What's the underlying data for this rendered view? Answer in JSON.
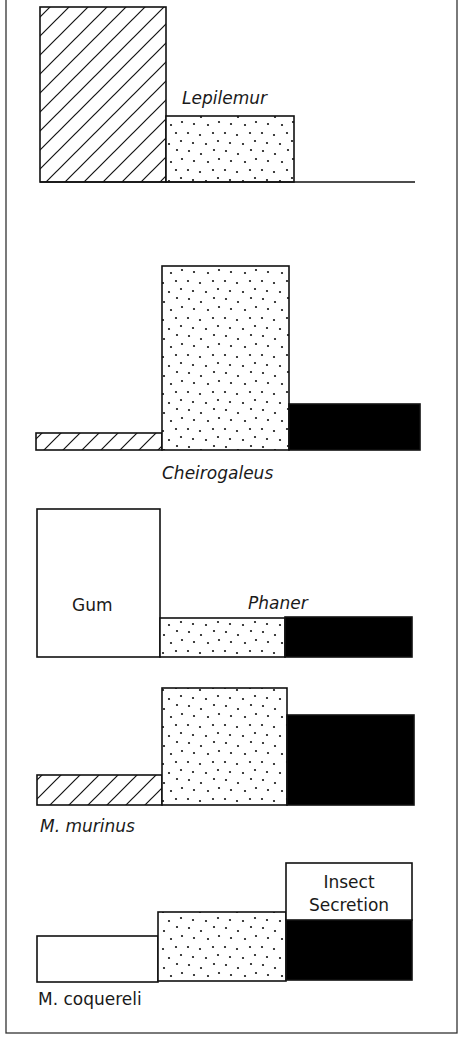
{
  "frame": {
    "x": 6,
    "y": -2,
    "width": 451,
    "height": 1035
  },
  "patterns": {
    "hatched": "hatch-pattern",
    "dotted": "dot-pattern",
    "black": "#000000",
    "white": "#ffffff"
  },
  "chart_data": {
    "type": "bar",
    "title": "",
    "xlabel": "",
    "ylabel": "",
    "legend": "inline labels: Gum (white), Insect Secretion (white box above black)",
    "categories": [
      "hatched",
      "dotted",
      "black"
    ],
    "panels": [
      {
        "species": "Lepilemur",
        "label_italic": true,
        "label": {
          "text": "Lepilemur",
          "x": 182,
          "y": 104,
          "size": 17
        },
        "baseline": {
          "x1": 40,
          "x2": 415,
          "y": 182
        },
        "bars": [
          {
            "fill": "hatched",
            "x": 40,
            "y": 7,
            "w": 126,
            "h": 175,
            "rel_height": 1.0
          },
          {
            "fill": "dotted",
            "x": 166,
            "y": 116,
            "w": 128,
            "h": 66,
            "rel_height": 0.38
          }
        ]
      },
      {
        "species": "Cheirogaleus",
        "label_italic": true,
        "label": {
          "text": "Cheirogaleus",
          "x": 162,
          "y": 479,
          "size": 17
        },
        "bars": [
          {
            "fill": "hatched",
            "x": 36,
            "y": 433,
            "w": 126,
            "h": 17,
            "rel_height": 0.09
          },
          {
            "fill": "dotted",
            "x": 162,
            "y": 266,
            "w": 127,
            "h": 184,
            "rel_height": 1.0
          },
          {
            "fill": "black",
            "x": 289,
            "y": 404,
            "w": 131,
            "h": 46,
            "rel_height": 0.25
          }
        ]
      },
      {
        "species": "Phaner",
        "label_italic": true,
        "label": {
          "text": "Phaner",
          "x": 248,
          "y": 609,
          "size": 17
        },
        "bars": [
          {
            "fill": "white",
            "x": 37,
            "y": 509,
            "w": 123,
            "h": 148,
            "rel_height": 1.0,
            "inner_label": {
              "text": "Gum",
              "x": 72,
              "y": 611,
              "size": 17
            }
          },
          {
            "fill": "dotted",
            "x": 160,
            "y": 618,
            "w": 125,
            "h": 39,
            "rel_height": 0.26
          },
          {
            "fill": "black",
            "x": 285,
            "y": 617,
            "w": 127,
            "h": 40,
            "rel_height": 0.27
          }
        ]
      },
      {
        "species": "M. murinus",
        "label_italic": true,
        "label": {
          "text": "M. murinus",
          "x": 40,
          "y": 832,
          "size": 17
        },
        "bars": [
          {
            "fill": "hatched",
            "x": 37,
            "y": 775,
            "w": 125,
            "h": 30,
            "rel_height": 0.26
          },
          {
            "fill": "dotted",
            "x": 162,
            "y": 688,
            "w": 125,
            "h": 117,
            "rel_height": 1.0
          },
          {
            "fill": "black",
            "x": 287,
            "y": 715,
            "w": 127,
            "h": 90,
            "rel_height": 0.77
          }
        ]
      },
      {
        "species": "M. coquereli",
        "label_italic": false,
        "label": {
          "text": "M. coquereli",
          "x": 38,
          "y": 1005,
          "size": 17
        },
        "bars": [
          {
            "fill": "white",
            "x": 37,
            "y": 936,
            "w": 121,
            "h": 46,
            "rel_height": 0.39
          },
          {
            "fill": "dotted",
            "x": 158,
            "y": 912,
            "w": 128,
            "h": 69,
            "rel_height": 0.59
          },
          {
            "fill": "black",
            "x": 286,
            "y": 920,
            "w": 126,
            "h": 60,
            "rel_height": 0.51
          },
          {
            "fill": "white",
            "x": 286,
            "y": 863,
            "w": 126,
            "h": 57,
            "rel_height": 0.49,
            "inner_label": {
              "lines": [
                "Insect",
                "Secretion"
              ],
              "x": 349,
              "y": 888,
              "size": 17,
              "line_gap": 23
            }
          }
        ]
      }
    ]
  }
}
